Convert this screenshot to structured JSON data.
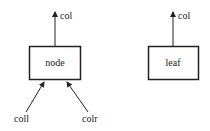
{
  "diagram": {
    "node": {
      "label": "node",
      "out": "col",
      "in_left": "coll",
      "in_right": "colr"
    },
    "leaf": {
      "label": "leaf",
      "out": "col"
    }
  }
}
